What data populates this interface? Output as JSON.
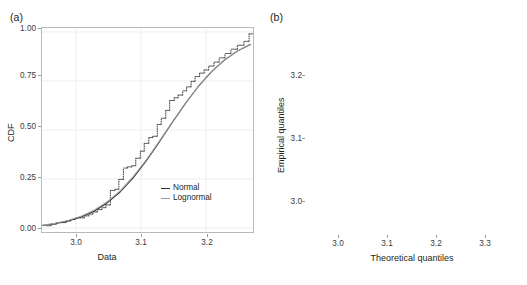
{
  "figure": {
    "panels": [
      {
        "id": "a",
        "label": "(a)"
      },
      {
        "id": "b",
        "label": "(b)"
      }
    ]
  },
  "panel_a": {
    "label": "(a)",
    "xlabel": "Data",
    "ylabel": "CDF",
    "xticks": [
      "3.0",
      "3.1",
      "3.2"
    ],
    "yticks": [
      "0.00",
      "0.25",
      "0.50",
      "0.75",
      "1.00"
    ],
    "legend": [
      {
        "name": "legend-normal",
        "label": "Normal",
        "color": "#2b2b2b"
      },
      {
        "name": "legend-lognormal",
        "label": "Lognormal",
        "color": "#9b9b9b"
      }
    ]
  },
  "panel_b": {
    "label": "(b)",
    "xlabel": "Theoretical quantiles",
    "ylabel": "Empirical quantiles",
    "xticks": [
      "3.0",
      "3.1",
      "3.2",
      "3.3"
    ],
    "yticks": [
      "3.0",
      "3.1",
      "3.2"
    ]
  },
  "chart_data": [
    {
      "panel": "a",
      "type": "line",
      "title": "",
      "xlabel": "Data",
      "ylabel": "CDF",
      "xlim": [
        2.948,
        3.272
      ],
      "ylim": [
        -0.02,
        1.02
      ],
      "xticks": [
        3.0,
        3.1,
        3.2
      ],
      "yticks": [
        0.0,
        0.25,
        0.5,
        0.75,
        1.0
      ],
      "grid": true,
      "legend_position": "inside-lower-right",
      "series": [
        {
          "name": "Empirical CDF (step)",
          "type": "step",
          "color": "#2b2b2b",
          "x": [
            2.954,
            2.962,
            2.97,
            2.985,
            2.992,
            2.999,
            3.013,
            3.02,
            3.026,
            3.033,
            3.04,
            3.046,
            3.053,
            3.06,
            3.066,
            3.073,
            3.079,
            3.086,
            3.092,
            3.099,
            3.105,
            3.112,
            3.118,
            3.125,
            3.131,
            3.138,
            3.144,
            3.151,
            3.157,
            3.164,
            3.17,
            3.177,
            3.183,
            3.19,
            3.197,
            3.204,
            3.212,
            3.22,
            3.229,
            3.238,
            3.248,
            3.258,
            3.266
          ],
          "y": [
            0.012,
            0.02,
            0.028,
            0.036,
            0.044,
            0.052,
            0.062,
            0.071,
            0.082,
            0.094,
            0.104,
            0.118,
            0.192,
            0.198,
            0.248,
            0.306,
            0.312,
            0.318,
            0.356,
            0.392,
            0.432,
            0.462,
            0.468,
            0.528,
            0.56,
            0.6,
            0.65,
            0.664,
            0.678,
            0.7,
            0.72,
            0.748,
            0.772,
            0.79,
            0.806,
            0.826,
            0.846,
            0.868,
            0.89,
            0.912,
            0.932,
            0.952,
            0.99
          ]
        },
        {
          "name": "Normal",
          "type": "curve",
          "color": "#2b2b2b",
          "x": [
            2.948,
            2.968,
            2.988,
            3.008,
            3.028,
            3.048,
            3.068,
            3.088,
            3.108,
            3.128,
            3.148,
            3.168,
            3.188,
            3.208,
            3.228,
            3.248,
            3.268
          ],
          "y": [
            0.013,
            0.022,
            0.036,
            0.056,
            0.086,
            0.128,
            0.184,
            0.256,
            0.342,
            0.438,
            0.538,
            0.634,
            0.722,
            0.796,
            0.856,
            0.902,
            0.936
          ]
        },
        {
          "name": "Lognormal",
          "type": "curve",
          "color": "#9b9b9b",
          "x": [
            2.948,
            2.968,
            2.988,
            3.008,
            3.028,
            3.048,
            3.068,
            3.088,
            3.108,
            3.128,
            3.148,
            3.168,
            3.188,
            3.208,
            3.228,
            3.248,
            3.268
          ],
          "y": [
            0.014,
            0.024,
            0.039,
            0.06,
            0.091,
            0.134,
            0.19,
            0.262,
            0.347,
            0.442,
            0.541,
            0.636,
            0.723,
            0.797,
            0.857,
            0.903,
            0.937
          ]
        }
      ]
    },
    {
      "panel": "b",
      "type": "scatter",
      "title": "",
      "xlabel": "Theoretical quantiles",
      "ylabel": "Empirical quantiles",
      "xlim": [
        2.935,
        3.335
      ],
      "ylim": [
        2.955,
        3.285
      ],
      "xticks": [
        3.0,
        3.1,
        3.2,
        3.3
      ],
      "yticks": [
        3.0,
        3.1,
        3.2
      ],
      "grid": true,
      "reference_line": {
        "name": "y = x",
        "color": "#9b9b9b",
        "from": [
          2.942,
          2.962
        ],
        "to": [
          3.268,
          3.278
        ]
      },
      "series": [
        {
          "name": "Normal",
          "color": "#151515",
          "points": [
            [
              2.944,
              2.97
            ],
            [
              2.983,
              2.991
            ],
            [
              3.0,
              2.993
            ],
            [
              3.014,
              3.02
            ],
            [
              3.025,
              3.022
            ],
            [
              3.037,
              3.026
            ],
            [
              3.045,
              3.028
            ],
            [
              3.052,
              3.03
            ],
            [
              3.058,
              3.047
            ],
            [
              3.062,
              3.05
            ],
            [
              3.066,
              3.053
            ],
            [
              3.07,
              3.063
            ],
            [
              3.073,
              3.065
            ],
            [
              3.076,
              3.068
            ],
            [
              3.079,
              3.07
            ],
            [
              3.082,
              3.072
            ],
            [
              3.086,
              3.058
            ],
            [
              3.089,
              3.062
            ],
            [
              3.092,
              3.074
            ],
            [
              3.096,
              3.089
            ],
            [
              3.1,
              3.096
            ],
            [
              3.103,
              3.101
            ],
            [
              3.107,
              3.113
            ],
            [
              3.11,
              3.119
            ],
            [
              3.113,
              3.122
            ],
            [
              3.116,
              3.126
            ],
            [
              3.119,
              3.129
            ],
            [
              3.122,
              3.132
            ],
            [
              3.096,
              3.133
            ],
            [
              3.1,
              3.136
            ],
            [
              3.104,
              3.139
            ],
            [
              3.108,
              3.128
            ],
            [
              3.112,
              3.141
            ],
            [
              3.118,
              3.143
            ],
            [
              3.124,
              3.137
            ],
            [
              3.128,
              3.14
            ],
            [
              3.133,
              3.145
            ],
            [
              3.138,
              3.146
            ],
            [
              3.141,
              3.147
            ],
            [
              3.145,
              3.148
            ],
            [
              3.15,
              3.148
            ],
            [
              3.155,
              3.15
            ],
            [
              3.158,
              3.148
            ],
            [
              3.162,
              3.158
            ],
            [
              3.167,
              3.162
            ],
            [
              3.172,
              3.166
            ],
            [
              3.177,
              3.172
            ],
            [
              3.18,
              3.182
            ],
            [
              3.185,
              3.183
            ],
            [
              3.19,
              3.188
            ],
            [
              3.196,
              3.193
            ],
            [
              3.203,
              3.198
            ],
            [
              3.208,
              3.214
            ],
            [
              3.213,
              3.224
            ],
            [
              3.218,
              3.231
            ],
            [
              3.222,
              3.238
            ],
            [
              3.228,
              3.244
            ],
            [
              3.233,
              3.249
            ],
            [
              3.24,
              3.258
            ],
            [
              3.246,
              3.266
            ],
            [
              3.253,
              3.262
            ],
            [
              3.262,
              3.25
            ],
            [
              3.272,
              3.256
            ]
          ]
        },
        {
          "name": "Lognormal",
          "color": "#a6a6a6",
          "points": [
            [
              2.948,
              2.963
            ],
            [
              2.985,
              2.99
            ],
            [
              3.002,
              2.992
            ],
            [
              3.017,
              3.018
            ],
            [
              3.028,
              3.02
            ],
            [
              3.04,
              3.024
            ],
            [
              3.048,
              3.027
            ],
            [
              3.056,
              3.03
            ],
            [
              3.06,
              3.044
            ],
            [
              3.065,
              3.047
            ],
            [
              3.069,
              3.049
            ],
            [
              3.073,
              3.051
            ],
            [
              3.077,
              3.054
            ],
            [
              3.081,
              3.056
            ],
            [
              3.085,
              3.048
            ],
            [
              3.09,
              3.049
            ],
            [
              3.094,
              3.049
            ],
            [
              3.098,
              3.05
            ],
            [
              3.102,
              3.072
            ],
            [
              3.106,
              3.08
            ],
            [
              3.11,
              3.1
            ],
            [
              3.114,
              3.108
            ],
            [
              3.118,
              3.113
            ],
            [
              3.122,
              3.118
            ],
            [
              3.126,
              3.124
            ],
            [
              3.13,
              3.127
            ],
            [
              3.1,
              3.131
            ],
            [
              3.104,
              3.134
            ],
            [
              3.108,
              3.137
            ],
            [
              3.113,
              3.14
            ],
            [
              3.118,
              3.143
            ],
            [
              3.123,
              3.146
            ],
            [
              3.128,
              3.149
            ],
            [
              3.132,
              3.152
            ],
            [
              3.119,
              3.156
            ],
            [
              3.124,
              3.159
            ],
            [
              3.13,
              3.162
            ],
            [
              3.136,
              3.165
            ],
            [
              3.141,
              3.168
            ],
            [
              3.146,
              3.148
            ],
            [
              3.152,
              3.149
            ],
            [
              3.158,
              3.152
            ],
            [
              3.164,
              3.172
            ],
            [
              3.169,
              3.176
            ],
            [
              3.174,
              3.18
            ],
            [
              3.18,
              3.188
            ],
            [
              3.186,
              3.192
            ],
            [
              3.192,
              3.196
            ],
            [
              3.198,
              3.202
            ],
            [
              3.205,
              3.213
            ],
            [
              3.211,
              3.222
            ],
            [
              3.217,
              3.232
            ],
            [
              3.223,
              3.24
            ],
            [
              3.229,
              3.248
            ],
            [
              3.236,
              3.256
            ],
            [
              3.243,
              3.262
            ],
            [
              3.25,
              3.258
            ],
            [
              3.258,
              3.253
            ],
            [
              3.268,
              3.246
            ],
            [
              3.283,
              3.248
            ],
            [
              3.322,
              3.266
            ]
          ]
        }
      ]
    }
  ]
}
